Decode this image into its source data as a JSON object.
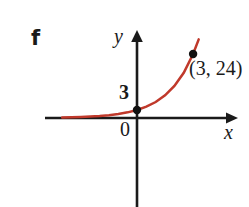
{
  "figure": {
    "part_label": "f",
    "background_color": "#ffffff"
  },
  "axes": {
    "y_label": "y",
    "x_label": "x",
    "origin_label": "0",
    "axis_color": "#1a1a1a"
  },
  "annotations": {
    "y_intercept_label": "3",
    "point_label": "(3, 24)"
  },
  "chart_data": {
    "type": "line",
    "title": "",
    "subtitle": "",
    "xlabel": "x",
    "ylabel": "y",
    "curve_color": "#c0392b",
    "grid": false,
    "legend": null,
    "xlim": [
      -4.2,
      4.2
    ],
    "ylim": [
      -6,
      32
    ],
    "series": [
      {
        "name": "y = 3 · 2^x",
        "x": [
          -4,
          -3.5,
          -3,
          -2.5,
          -2,
          -1.5,
          -1,
          -0.5,
          0,
          0.5,
          1,
          1.5,
          2,
          2.5,
          3,
          3.3
        ],
        "values": [
          0.19,
          0.27,
          0.38,
          0.53,
          0.75,
          1.06,
          1.5,
          2.12,
          3,
          4.24,
          6,
          8.49,
          12,
          16.97,
          24,
          29.5
        ]
      }
    ],
    "points": [
      {
        "label": "",
        "x": 0,
        "y": 3
      },
      {
        "label": "(3, 24)",
        "x": 3,
        "y": 24
      }
    ],
    "tick_labels": {
      "y": [
        "3"
      ],
      "x": []
    },
    "annotations": [
      "0",
      "3",
      "(3, 24)"
    ]
  }
}
